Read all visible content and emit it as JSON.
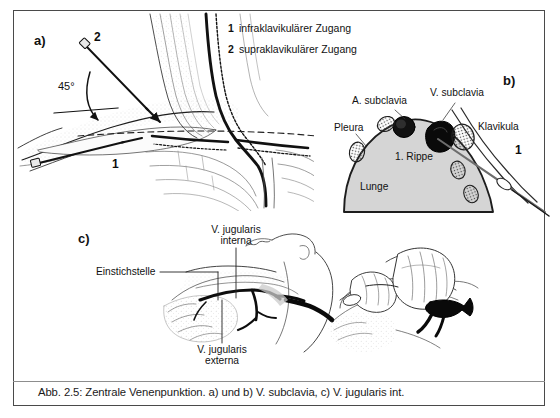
{
  "figure": {
    "caption": "Abb. 2.5: Zentrale Venenpunktion. a) und b) V. subclavia, c) V. jugularis int.",
    "border_color": "#4a4a4a",
    "background": "#ffffff",
    "lung_fill": "#d5d5d5"
  },
  "panel_a": {
    "letter": "a)",
    "angle_label": "45°",
    "marker_1": "1",
    "marker_2": "2",
    "legend": [
      {
        "num": "1",
        "text": "infraklavikulärer Zugang"
      },
      {
        "num": "2",
        "text": "supraklavikulärer Zugang"
      }
    ]
  },
  "panel_b": {
    "letter": "b)",
    "labels": {
      "arteria": "A. subclavia",
      "vena": "V. subclavia",
      "pleura": "Pleura",
      "klavikula": "Klavikula",
      "rippe": "1. Rippe",
      "lunge": "Lunge"
    },
    "marker_1": "1"
  },
  "panel_c": {
    "letter": "c)",
    "labels": {
      "einstichstelle": "Einstichstelle",
      "jugularis_interna_line1": "V. jugularis",
      "jugularis_interna_line2": "interna",
      "jugularis_externa_line1": "V. jugularis",
      "jugularis_externa_line2": "externa"
    }
  }
}
